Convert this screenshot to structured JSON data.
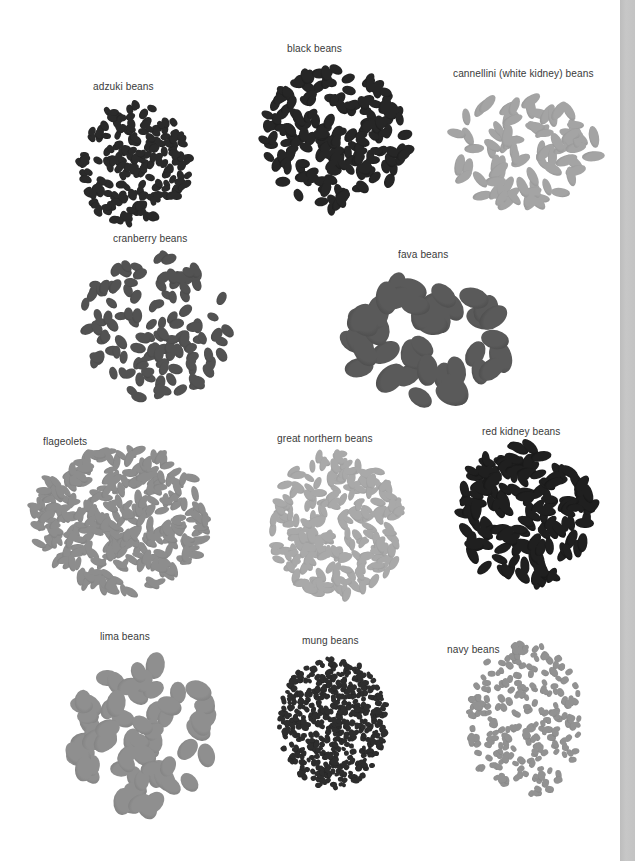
{
  "page": {
    "edge_color": "#c2c2c2"
  },
  "beans": [
    {
      "label": "adzuki beans",
      "label_x": 93,
      "label_y": 80,
      "pile": {
        "x": 70,
        "y": 100,
        "w": 125,
        "h": 128,
        "count": 210,
        "bw": 10,
        "bh": 7,
        "color": "#2a2a2a",
        "shade": "#1a1a1a"
      }
    },
    {
      "label": "black beans",
      "label_x": 287,
      "label_y": 42,
      "pile": {
        "x": 255,
        "y": 65,
        "w": 160,
        "h": 150,
        "count": 190,
        "bw": 14,
        "bh": 9,
        "color": "#262626",
        "shade": "#151515"
      }
    },
    {
      "label": "cannellini (white kidney) beans",
      "label_x": 453,
      "label_y": 67,
      "pile": {
        "x": 440,
        "y": 85,
        "w": 165,
        "h": 125,
        "count": 85,
        "bw": 20,
        "bh": 9,
        "color": "#a4a4a4",
        "shade": "#8a8a8a"
      }
    },
    {
      "label": "cranberry beans",
      "label_x": 113,
      "label_y": 232,
      "pile": {
        "x": 75,
        "y": 250,
        "w": 160,
        "h": 155,
        "count": 125,
        "bw": 14,
        "bh": 9,
        "color": "#525252",
        "shade": "#3e3e3e"
      }
    },
    {
      "label": "fava beans",
      "label_x": 398,
      "label_y": 248,
      "pile": {
        "x": 335,
        "y": 270,
        "w": 195,
        "h": 140,
        "count": 42,
        "bw": 30,
        "bh": 20,
        "color": "#5a5a5a",
        "shade": "#444444"
      }
    },
    {
      "label": "flageolets",
      "label_x": 43,
      "label_y": 435,
      "pile": {
        "x": 25,
        "y": 445,
        "w": 190,
        "h": 150,
        "count": 330,
        "bw": 15,
        "bh": 7,
        "color": "#8d8d8d",
        "shade": "#767676"
      }
    },
    {
      "label": "great northern beans",
      "label_x": 277,
      "label_y": 432,
      "pile": {
        "x": 262,
        "y": 450,
        "w": 150,
        "h": 150,
        "count": 250,
        "bw": 14,
        "bh": 7,
        "color": "#a9a9a9",
        "shade": "#919191"
      }
    },
    {
      "label": "red kidney beans",
      "label_x": 482,
      "label_y": 425,
      "pile": {
        "x": 450,
        "y": 440,
        "w": 150,
        "h": 150,
        "count": 160,
        "bw": 18,
        "bh": 9,
        "color": "#1f1f1f",
        "shade": "#0e0e0e"
      }
    },
    {
      "label": "lima beans",
      "label_x": 100,
      "label_y": 630,
      "pile": {
        "x": 60,
        "y": 655,
        "w": 170,
        "h": 160,
        "count": 70,
        "bw": 24,
        "bh": 17,
        "color": "#8f8f8f",
        "shade": "#777777"
      }
    },
    {
      "label": "mung beans",
      "label_x": 302,
      "label_y": 634,
      "pile": {
        "x": 275,
        "y": 655,
        "w": 115,
        "h": 135,
        "count": 560,
        "bw": 6,
        "bh": 5,
        "color": "#2d2d2d",
        "shade": "#1a1a1a"
      }
    },
    {
      "label": "navy beans",
      "label_x": 447,
      "label_y": 643,
      "pile": {
        "x": 462,
        "y": 640,
        "w": 125,
        "h": 160,
        "count": 230,
        "bw": 8,
        "bh": 6,
        "color": "#929292",
        "shade": "#7b7b7b"
      }
    }
  ]
}
